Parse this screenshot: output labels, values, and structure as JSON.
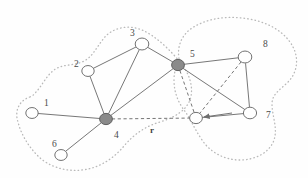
{
  "figure": {
    "width": 308,
    "height": 178,
    "background_color": "#fefefe"
  },
  "style": {
    "edge_color": "#707070",
    "dashed_edge_color": "#6e6e6e",
    "cluster_outline_color": "#b9b9b9",
    "node_stroke_color": "#6a6a6a",
    "node_open_fill": "#ffffff",
    "node_filled_fill": "#8a8a8a",
    "label_color": "#4a4a4a",
    "arrow_color": "#6e6e6e"
  },
  "nodes": [
    {
      "id": "1",
      "label": "1",
      "x": 32,
      "y": 113,
      "r": 6.2,
      "filled": false,
      "label_x": 44,
      "label_y": 99
    },
    {
      "id": "2",
      "label": "2",
      "x": 88,
      "y": 71,
      "r": 6.2,
      "filled": false,
      "label_x": 74,
      "label_y": 60
    },
    {
      "id": "3",
      "label": "3",
      "x": 142,
      "y": 44,
      "r": 6.8,
      "filled": false,
      "label_x": 130,
      "label_y": 29
    },
    {
      "id": "4",
      "label": "4",
      "x": 106,
      "y": 119,
      "r": 6.4,
      "filled": true,
      "label_x": 114,
      "label_y": 131
    },
    {
      "id": "5",
      "label": "5",
      "x": 178,
      "y": 65,
      "r": 6.4,
      "filled": true,
      "label_x": 190,
      "label_y": 50
    },
    {
      "id": "6",
      "label": "6",
      "x": 61,
      "y": 155,
      "r": 6.2,
      "filled": false,
      "label_x": 52,
      "label_y": 140
    },
    {
      "id": "7",
      "label": "7",
      "x": 250,
      "y": 113,
      "r": 6.6,
      "filled": false,
      "label_x": 266,
      "label_y": 111
    },
    {
      "id": "8",
      "label": "8",
      "x": 245,
      "y": 57,
      "r": 6.8,
      "filled": false,
      "label_x": 263,
      "label_y": 40
    },
    {
      "id": "r",
      "label": "",
      "x": 196,
      "y": 118,
      "r": 6.4,
      "filled": false,
      "label_x": 0,
      "label_y": 0
    }
  ],
  "edges_solid": [
    {
      "from": "1",
      "to": "4"
    },
    {
      "from": "6",
      "to": "4"
    },
    {
      "from": "2",
      "to": "4"
    },
    {
      "from": "2",
      "to": "3"
    },
    {
      "from": "3",
      "to": "4"
    },
    {
      "from": "3",
      "to": "5"
    },
    {
      "from": "4",
      "to": "5"
    },
    {
      "from": "5",
      "to": "8"
    },
    {
      "from": "5",
      "to": "7"
    },
    {
      "from": "8",
      "to": "7"
    },
    {
      "from": "7",
      "to": "r"
    }
  ],
  "edges_dashed": [
    {
      "from": "4",
      "to": "r"
    },
    {
      "from": "5",
      "to": "r"
    },
    {
      "from": "8",
      "to": "r"
    }
  ],
  "annotations": {
    "vector_label": "r",
    "vector_label_x": 150,
    "vector_label_y": 126,
    "arrow": {
      "name": "arrow-to-centroid",
      "from_x": 232,
      "from_y": 113,
      "to_x": 204,
      "to_y": 117
    }
  },
  "clusters": [
    {
      "name": "left-cluster",
      "path": "M 30 97 C 20 100 14 110 18 122 C 21 134 28 146 38 156 C 48 166 64 172 82 170 C 100 168 114 158 124 146 C 134 134 146 126 160 122 C 176 117 186 110 190 100 C 194 88 190 74 180 62 C 170 50 156 36 142 30 C 128 24 112 28 104 38 C 96 48 92 58 82 62 C 72 66 62 64 54 70 C 46 76 42 86 36 92 C 34 95 32 96 30 97 Z"
    },
    {
      "name": "right-cluster",
      "path": "M 180 62 C 176 50 180 36 192 28 C 206 19 224 16 242 18 C 262 20 280 28 290 42 C 300 56 298 72 288 82 C 280 90 272 94 272 104 C 272 116 278 128 274 140 C 270 152 256 160 240 160 C 224 160 210 152 202 140 C 194 128 190 118 184 110 C 178 102 174 92 174 80 C 174 72 176 66 180 62 Z"
    }
  ]
}
